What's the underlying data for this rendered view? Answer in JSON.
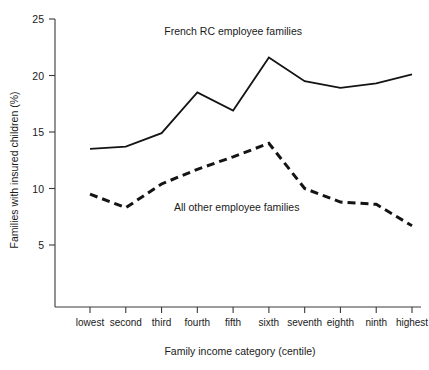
{
  "chart_data": {
    "type": "line",
    "title": "",
    "xlabel": "Family income category (centile)",
    "ylabel": "Families with insured children (%)",
    "categories": [
      "lowest",
      "second",
      "third",
      "fourth",
      "fifth",
      "sixth",
      "seventh",
      "eighth",
      "ninth",
      "highest"
    ],
    "series": [
      {
        "name": "French RC employee families",
        "style": "solid",
        "color": "#141414",
        "values": [
          13.5,
          13.7,
          14.9,
          18.5,
          16.9,
          21.6,
          19.5,
          18.9,
          19.3,
          20.1
        ]
      },
      {
        "name": "All other employee families",
        "style": "dashed",
        "color": "#141414",
        "values": [
          9.5,
          8.3,
          10.4,
          11.7,
          12.8,
          14.0,
          10.0,
          8.8,
          8.6,
          6.7
        ]
      }
    ],
    "ylim": [
      0,
      25
    ],
    "yticks": [
      5,
      10,
      15,
      20,
      25
    ],
    "ytick_labels": [
      "5",
      "10",
      "15",
      "20",
      "25"
    ],
    "grid": false,
    "legend": "inline-annotations",
    "annotations": [
      {
        "name": "french-rc-label",
        "text": "French RC employee families",
        "x_category_index": 4.0,
        "y_value": 23.6
      },
      {
        "name": "all-other-label",
        "text": "All other employee families",
        "x_category_index": 4.1,
        "y_value": 8.0
      }
    ]
  }
}
